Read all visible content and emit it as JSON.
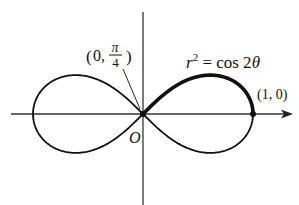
{
  "figure": {
    "equation": {
      "r": "r",
      "sup": "2",
      "rest": " = cos 2",
      "theta": "θ"
    },
    "point_origin_label": {
      "open": "(0, ",
      "num": "π",
      "den": "4",
      "close": ")"
    },
    "point_one_label": "(1, 0)",
    "origin_label": "O",
    "colors": {
      "curve": "#111111",
      "axis": "#333333",
      "background": "#ffffff"
    }
  }
}
